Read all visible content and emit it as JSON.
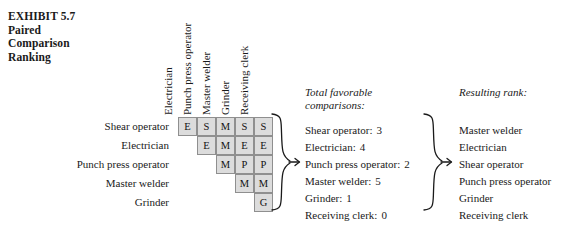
{
  "exhibit": {
    "number": "EXHIBIT 5.7",
    "title_line1": "Paired",
    "title_line2": "Comparison",
    "title_line3": "Ranking"
  },
  "matrix": {
    "column_headers": [
      "Electrician",
      "Punch press operator",
      "Master welder",
      "Grinder",
      "Receiving clerk"
    ],
    "row_labels": [
      "Shear operator",
      "Electrician",
      "Punch press operator",
      "Master welder",
      "Grinder"
    ],
    "rows": [
      {
        "offset": 0,
        "cells": [
          "E",
          "S",
          "M",
          "S",
          "S"
        ]
      },
      {
        "offset": 1,
        "cells": [
          "E",
          "M",
          "E",
          "E"
        ]
      },
      {
        "offset": 2,
        "cells": [
          "M",
          "P",
          "P"
        ]
      },
      {
        "offset": 3,
        "cells": [
          "M",
          "M"
        ]
      },
      {
        "offset": 4,
        "cells": [
          "G"
        ]
      }
    ]
  },
  "totals": {
    "heading_line1": "Total favorable",
    "heading_line2": "comparisons:",
    "items": [
      {
        "label": "Shear operator:",
        "value": "3"
      },
      {
        "label": "Electrician:",
        "value": "4"
      },
      {
        "label": "Punch press operator:",
        "value": "2"
      },
      {
        "label": "Master welder:",
        "value": "5"
      },
      {
        "label": "Grinder:",
        "value": "1"
      },
      {
        "label": "Receiving clerk:",
        "value": "0"
      }
    ]
  },
  "rank": {
    "heading": "Resulting rank:",
    "items": [
      "Master welder",
      "Electrician",
      "Shear operator",
      "Punch press operator",
      "Grinder",
      "Receiving clerk"
    ]
  },
  "style": {
    "cell_fill": "#dcdcdc",
    "cell_border": "#8f8f8f",
    "text_color": "#1a1a1a",
    "background": "#ffffff"
  }
}
